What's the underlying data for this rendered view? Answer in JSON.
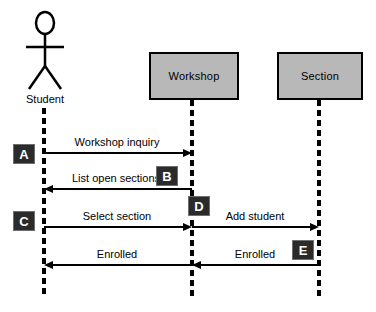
{
  "diagram": {
    "type": "uml-sequence-diagram",
    "background_color": "#ffffff",
    "line_color": "#000000",
    "box_fill_color": "#b8b8b8",
    "marker_fill_color": "#2b2b2b",
    "marker_text_color": "#ffffff"
  },
  "participants": [
    {
      "id": "student",
      "label": "Student",
      "kind": "actor",
      "lifeline_x": 44
    },
    {
      "id": "workshop",
      "label": "Workshop",
      "kind": "object",
      "lifeline_x": 192
    },
    {
      "id": "section",
      "label": "Section",
      "kind": "object",
      "lifeline_x": 319
    }
  ],
  "messages": [
    {
      "id": "m1",
      "label": "Workshop inquiry",
      "from": "student",
      "to": "workshop",
      "direction": "right",
      "y": 153
    },
    {
      "id": "m2",
      "label": "List open sections",
      "from": "workshop",
      "to": "student",
      "direction": "left",
      "y": 189
    },
    {
      "id": "m3",
      "label": "Select section",
      "from": "student",
      "to": "workshop",
      "direction": "right",
      "y": 227
    },
    {
      "id": "m4",
      "label": "Add student",
      "from": "workshop",
      "to": "section",
      "direction": "right",
      "y": 227
    },
    {
      "id": "m5",
      "label": "Enrolled",
      "from": "workshop",
      "to": "student",
      "direction": "left",
      "y": 265
    },
    {
      "id": "m6",
      "label": "Enrolled",
      "from": "section",
      "to": "workshop",
      "direction": "left",
      "y": 265
    }
  ],
  "markers": [
    {
      "id": "marker-a",
      "label": "A",
      "x": 13,
      "y": 144
    },
    {
      "id": "marker-b",
      "label": "B",
      "x": 156,
      "y": 166
    },
    {
      "id": "marker-c",
      "label": "C",
      "x": 13,
      "y": 211
    },
    {
      "id": "marker-d",
      "label": "D",
      "x": 188,
      "y": 196
    },
    {
      "id": "marker-e",
      "label": "E",
      "x": 292,
      "y": 240
    }
  ]
}
